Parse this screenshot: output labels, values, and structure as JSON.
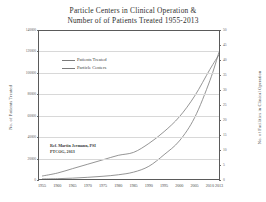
{
  "chart": {
    "title_line1": "Particle Centers in Clinical Operation &",
    "title_line2": "Number of of Patients Treated 1955-2013",
    "y_left_title": "No. of Patients Treated",
    "y_right_title": "No. of Facilities in Clinical Operation",
    "source_line1": "Ref. Martin  Jermann, PSI",
    "source_line2": "PTCOG, 2013",
    "legend": [
      {
        "label": "Patients Treated",
        "color": "#7a7a7a"
      },
      {
        "label": "Particle Centers",
        "color": "#7a7a7a"
      }
    ]
  },
  "chart_data": {
    "type": "line",
    "title": "Particle Centers in Clinical Operation & Number of of Patients Treated 1955-2013",
    "xlabel": "",
    "ylabel": "No. of Patients Treated",
    "y2label": "No. of Facilities in Clinical Operation",
    "grid": true,
    "legend_position": "upper-left-inside",
    "x": [
      1955,
      1960,
      1965,
      1970,
      1975,
      1980,
      1985,
      1990,
      1995,
      2000,
      2005,
      2010,
      2013
    ],
    "xlim": [
      1954,
      2013
    ],
    "xticklabels": [
      "1955",
      "1960",
      "1965",
      "1970",
      "1975",
      "1980",
      "1985",
      "1990",
      "1995",
      "2000",
      "2005",
      "2010",
      "2013"
    ],
    "ylim": [
      0,
      140000
    ],
    "yticklabels": [
      "0",
      "20000",
      "40000",
      "60000",
      "80000",
      "100000",
      "120000",
      "140000"
    ],
    "yticks": [
      0,
      20000,
      40000,
      60000,
      80000,
      100000,
      120000,
      140000
    ],
    "y2lim": [
      0,
      50
    ],
    "y2ticklabels": [
      "0",
      "5",
      "10",
      "15",
      "20",
      "25",
      "30",
      "35",
      "40",
      "45",
      "50"
    ],
    "y2ticks": [
      0,
      5,
      10,
      15,
      20,
      25,
      30,
      35,
      40,
      45,
      50
    ],
    "series": [
      {
        "name": "Patients Treated",
        "axis": "left",
        "color": "#7a7a7a",
        "values": [
          100,
          300,
          800,
          1600,
          2600,
          4000,
          6500,
          12000,
          23000,
          36000,
          58000,
          93000,
          120000
        ]
      },
      {
        "name": "Particle Centers",
        "axis": "right",
        "color": "#7a7a7a",
        "values": [
          1,
          2,
          3.5,
          5,
          6.5,
          8,
          9,
          12,
          16,
          21,
          28,
          37,
          42
        ]
      }
    ],
    "annotations": [
      {
        "text": "Ref. Martin  Jermann, PSI",
        "x": 1962,
        "y": 26000
      },
      {
        "text": "PTCOG, 2013",
        "x": 1962,
        "y": 22000
      }
    ]
  }
}
